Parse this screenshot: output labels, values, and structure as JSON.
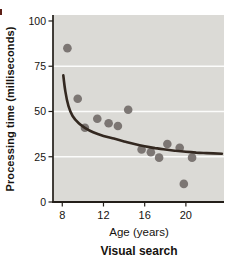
{
  "figure": {
    "y_axis_label": "Processing time (milliseconds)",
    "x_axis_label": "Age (years)",
    "caption": "Visual search"
  },
  "chart_data": {
    "type": "scatter",
    "title": "Visual search",
    "xlabel": "Age (years)",
    "ylabel": "Processing time (milliseconds)",
    "xlim": [
      7.1,
      23.7
    ],
    "ylim": [
      0,
      103.3
    ],
    "x_ticks": [
      8,
      12,
      16,
      20
    ],
    "y_ticks": [
      0,
      25,
      50,
      75,
      100
    ],
    "gridlines_y": [
      25,
      50,
      75
    ],
    "grid_on": true,
    "legend": "none",
    "colors": {
      "plot_background": "#dbdad6",
      "gridline": "#ffffff",
      "axis": "#231e19",
      "point": "#746e6c",
      "curve": "#332820",
      "text": "#16130f"
    },
    "series": [
      {
        "name": "observed-processing-times",
        "kind": "scatter",
        "points": [
          [
            8.5,
            85
          ],
          [
            9.5,
            57
          ],
          [
            10.2,
            41
          ],
          [
            11.4,
            46
          ],
          [
            12.5,
            43.5
          ],
          [
            13.4,
            42
          ],
          [
            14.4,
            51
          ],
          [
            15.7,
            29
          ],
          [
            16.6,
            27.5
          ],
          [
            17.4,
            24.5
          ],
          [
            18.2,
            32
          ],
          [
            19.4,
            30
          ],
          [
            19.8,
            10
          ],
          [
            20.6,
            24.5
          ]
        ]
      },
      {
        "name": "fitted-decay-curve",
        "kind": "line",
        "points": [
          [
            8.1,
            70
          ],
          [
            8.3,
            61
          ],
          [
            8.6,
            53
          ],
          [
            9.0,
            47.5
          ],
          [
            9.6,
            43.5
          ],
          [
            10.2,
            41
          ],
          [
            11,
            38.5
          ],
          [
            12,
            36.5
          ],
          [
            13,
            35
          ],
          [
            14,
            33.5
          ],
          [
            15,
            32
          ],
          [
            16,
            30.8
          ],
          [
            17,
            29.8
          ],
          [
            18,
            29
          ],
          [
            19,
            28.3
          ],
          [
            20,
            27.8
          ],
          [
            21,
            27.3
          ],
          [
            22,
            27
          ],
          [
            23.5,
            26.6
          ]
        ]
      }
    ]
  }
}
